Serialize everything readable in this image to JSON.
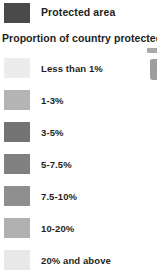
{
  "legend": {
    "header": {
      "label": "Protected area",
      "swatch_color": "#4a4a4a",
      "swatch_name": "protected-area-swatch"
    },
    "section_title": "Proportion of country protected",
    "scale": {
      "type": "choropleth-legend",
      "items": [
        {
          "label": "Less than 1%",
          "color": "#ececec"
        },
        {
          "label": "1-3%",
          "color": "#b4b4b4"
        },
        {
          "label": "3-5%",
          "color": "#737373"
        },
        {
          "label": "5-7.5%",
          "color": "#808080"
        },
        {
          "label": "7.5-10%",
          "color": "#8f8f8f"
        },
        {
          "label": "10-20%",
          "color": "#b0b0b0"
        },
        {
          "label": "20% and above",
          "color": "#e8e8e8"
        }
      ]
    },
    "edge_fragments": [
      {
        "name": "map-fragment-upper",
        "color": "#a9a9a9"
      },
      {
        "name": "map-fragment-lower",
        "color": "#9d9d9d"
      }
    ],
    "text_color": "#231f20",
    "background_color": "#ffffff"
  }
}
